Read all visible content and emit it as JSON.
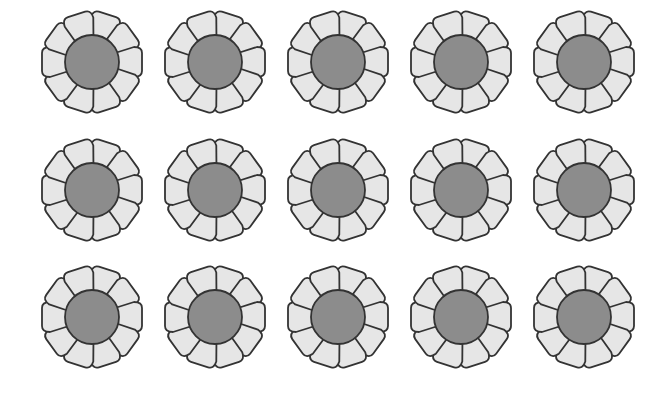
{
  "scene": {
    "description": "Grid of identical flowers",
    "rows": 3,
    "columns": 5,
    "total_flowers": 15
  },
  "flower": {
    "petal_count": 10,
    "petal_color": "#e6e6e6",
    "center_color": "#8c8c8c",
    "outline_color": "#333333",
    "outer_radius": 50,
    "center_radius": 27
  },
  "layout": {
    "column_x": [
      92,
      215,
      338,
      461,
      584
    ],
    "row_y": [
      62,
      190,
      317
    ]
  },
  "colors": {
    "background": "#ffffff"
  }
}
